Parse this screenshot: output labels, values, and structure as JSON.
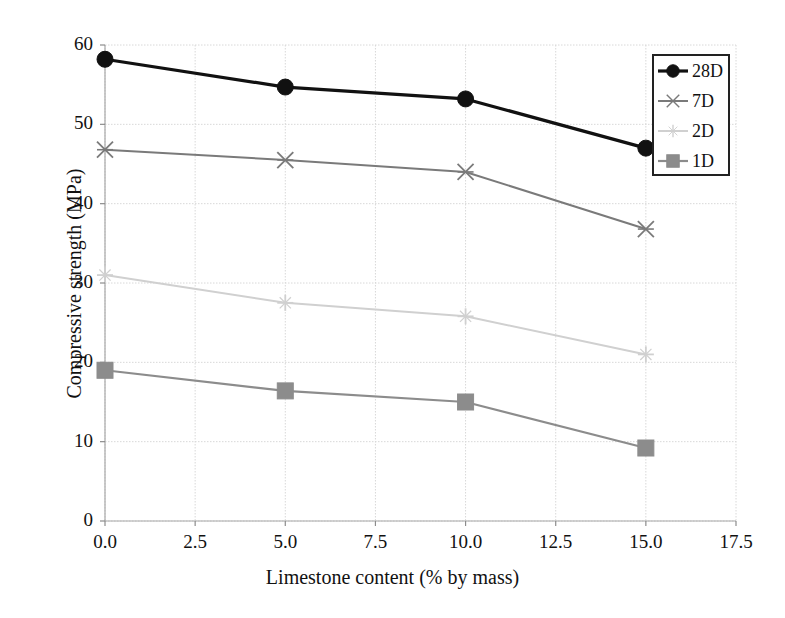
{
  "chart_data": {
    "type": "line",
    "title": "",
    "xlabel": "Limestone content (% by mass)",
    "ylabel": "Compressive strength (MPa)",
    "x": [
      0.0,
      5.0,
      10.0,
      15.0
    ],
    "xlim": [
      0.0,
      17.5
    ],
    "ylim": [
      0,
      60
    ],
    "xticks": [
      "0.0",
      "2.5",
      "5.0",
      "7.5",
      "10.0",
      "12.5",
      "15.0",
      "17.5"
    ],
    "xtick_values": [
      0.0,
      2.5,
      5.0,
      7.5,
      10.0,
      12.5,
      15.0,
      17.5
    ],
    "yticks": [
      "0",
      "10",
      "20",
      "30",
      "40",
      "50",
      "60"
    ],
    "ytick_values": [
      0,
      10,
      20,
      30,
      40,
      50,
      60
    ],
    "grid": true,
    "legend_position": "upper-right",
    "series": [
      {
        "name": "28D",
        "values": [
          58.2,
          54.7,
          53.2,
          47.0
        ],
        "color": "#111111",
        "marker": "circle",
        "line_width": 3.2
      },
      {
        "name": "7D",
        "values": [
          46.8,
          45.5,
          44.0,
          36.8
        ],
        "color": "#7a7a7a",
        "marker": "x",
        "line_width": 2.0
      },
      {
        "name": "2D",
        "values": [
          31.0,
          27.5,
          25.8,
          21.0
        ],
        "color": "#d0d0d0",
        "marker": "plus",
        "line_width": 2.0
      },
      {
        "name": "1D",
        "values": [
          19.0,
          16.4,
          15.0,
          9.2
        ],
        "color": "#8c8c8c",
        "marker": "square",
        "line_width": 2.2
      }
    ]
  },
  "legend": {
    "items": [
      {
        "label": "28D"
      },
      {
        "label": "7D"
      },
      {
        "label": "2D"
      },
      {
        "label": "1D"
      }
    ]
  },
  "axes": {
    "x_title": "Limestone content (% by mass)",
    "y_title": "Compressive strength (MPa)",
    "x_tick_labels": [
      "0.0",
      "2.5",
      "5.0",
      "7.5",
      "10.0",
      "12.5",
      "15.0",
      "17.5"
    ],
    "y_tick_labels": [
      "0",
      "10",
      "20",
      "30",
      "40",
      "50",
      "60"
    ]
  },
  "colors": {
    "grid": "#d8d8d8",
    "axis": "#b5b5b5",
    "background": "#ffffff",
    "series_28d": "#111111",
    "series_7d": "#7a7a7a",
    "series_2d": "#d0d0d0",
    "series_1d": "#8c8c8c"
  }
}
